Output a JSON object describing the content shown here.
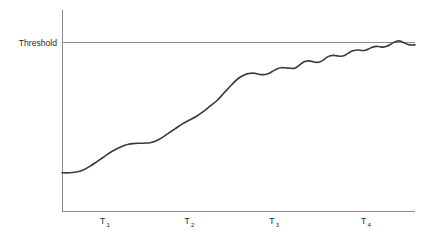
{
  "chart_data": {
    "type": "line",
    "title": "",
    "subtitle": "",
    "xlabel": "",
    "ylabel": "",
    "grid": false,
    "legend": null,
    "xlim": [
      0,
      100
    ],
    "ylim": [
      0,
      100
    ],
    "annotations": [
      {
        "name": "threshold",
        "label": "Threshold",
        "type": "horizontal-line",
        "y": 88,
        "color": "#8c8c8c"
      }
    ],
    "axis": {
      "x_axis_color": "#8c8c8c",
      "y_axis_color": "#8c8c8c",
      "x_tick_labels": [
        "T",
        "T",
        "T",
        "T"
      ],
      "x_tick_subscripts": [
        "1",
        "2",
        "3",
        "4"
      ],
      "x_tick_positions": [
        12,
        36,
        60,
        86
      ]
    },
    "series": [
      {
        "name": "growth",
        "color": "#3a3a3a",
        "x": [
          0,
          2,
          4,
          6,
          8,
          10,
          12,
          14,
          16,
          18,
          19,
          20,
          21,
          22,
          23,
          24,
          25,
          26,
          27,
          28,
          30,
          32,
          34,
          36,
          38,
          40,
          42,
          44,
          46,
          48,
          50,
          52,
          53,
          54,
          55,
          56,
          57,
          58,
          59,
          60,
          61,
          62,
          63,
          64,
          65,
          66,
          67,
          68,
          69,
          70,
          71,
          72,
          73,
          74,
          75,
          76,
          77,
          78,
          79,
          80,
          81,
          82,
          83,
          84,
          85,
          86,
          87,
          88,
          89,
          90,
          91,
          92,
          93,
          94,
          95,
          96,
          97,
          98,
          99,
          100
        ],
        "y": [
          20,
          20,
          20.4,
          21.5,
          23.5,
          26,
          28.5,
          31,
          33,
          34.5,
          35,
          35.3,
          35.4,
          35.5,
          35.5,
          35.6,
          35.7,
          36.2,
          37,
          38,
          40.5,
          43,
          45.5,
          47.5,
          49.5,
          52,
          55,
          58,
          62,
          66,
          69.5,
          71.5,
          72,
          72.2,
          72,
          71.5,
          71.4,
          71.6,
          72.4,
          73.5,
          74.5,
          75,
          75,
          74.8,
          74.7,
          74.8,
          76,
          77.5,
          78.4,
          78.6,
          78.2,
          77.8,
          78,
          79,
          80.4,
          81.3,
          81.5,
          81.2,
          81,
          81.4,
          82.5,
          83.6,
          84.2,
          84.3,
          84,
          84.2,
          85,
          85.8,
          86.2,
          86,
          85.8,
          86.2,
          87.2,
          88.3,
          89,
          88.9,
          88,
          87.2,
          86.9,
          87
        ]
      }
    ]
  },
  "labels": {
    "threshold": "Threshold",
    "tick_1_base": "T",
    "tick_1_sub": "1",
    "tick_2_base": "T",
    "tick_2_sub": "2",
    "tick_3_base": "T",
    "tick_3_sub": "3",
    "tick_4_base": "T",
    "tick_4_sub": "4"
  }
}
